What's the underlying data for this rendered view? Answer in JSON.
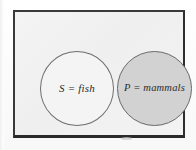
{
  "figure": {
    "type": "venn-disjoint-sets",
    "caption": "",
    "universe_label": ""
  },
  "sets": [
    {
      "id": "fish",
      "label": "S = fish",
      "symbol": "S",
      "name": "fish",
      "fill": "#f4f4f4",
      "stroke": "#6e6e6e",
      "shaded": false
    },
    {
      "id": "mammals",
      "label": "P = mammals",
      "symbol": "P",
      "name": "mammals",
      "fill": "#d2d2d2",
      "stroke": "#6a6a6a",
      "shaded": true
    }
  ],
  "frame": {
    "border_color": "#3a3a3a",
    "background": "#f2f2f2"
  },
  "page": {
    "background": "#ffffff"
  }
}
